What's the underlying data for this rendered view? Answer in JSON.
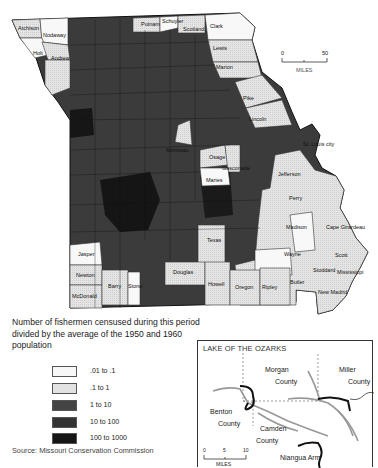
{
  "map": {
    "title": "Missouri counties — fishermen censused per capita",
    "scale_bar": {
      "start": "0",
      "end": "50",
      "unit": "MILES"
    },
    "labeled_counties": [
      {
        "name": "Atchison",
        "class": ".01 to .1"
      },
      {
        "name": "Nodaway",
        "class": ".01 to .1"
      },
      {
        "name": "Holt",
        "class": ".01 to .1"
      },
      {
        "name": "Andrew",
        "class": ".1 to 1"
      },
      {
        "name": "Buchanan",
        "class": ".1 to 1"
      },
      {
        "name": "Putnam",
        "class": ".1 to 1"
      },
      {
        "name": "Schuyler",
        "class": ".01 to .1"
      },
      {
        "name": "Scotland",
        "class": ".1 to 1"
      },
      {
        "name": "Clark",
        "class": ".01 to .1"
      },
      {
        "name": "Lewis",
        "class": ".1 to 1"
      },
      {
        "name": "Marion",
        "class": ".1 to 1"
      },
      {
        "name": "Pike",
        "class": ".1 to 1"
      },
      {
        "name": "Lincoln",
        "class": ".1 to 1"
      },
      {
        "name": "St. Louis city",
        "class": "outside"
      },
      {
        "name": "Moniteau",
        "class": ".1 to 1"
      },
      {
        "name": "Osage",
        "class": ".1 to 1"
      },
      {
        "name": "Gasconade",
        "class": ".1 to 1"
      },
      {
        "name": "Maries",
        "class": ".01 to .1"
      },
      {
        "name": "Jefferson",
        "class": ".1 to 1"
      },
      {
        "name": "Washington",
        "class": ".1 to 1"
      },
      {
        "name": "Ste. Genevieve",
        "class": ".1 to 1"
      },
      {
        "name": "St. Francois",
        "class": ".1 to 1"
      },
      {
        "name": "Perry",
        "class": ".1 to 1"
      },
      {
        "name": "Madison",
        "class": ".1 to 1"
      },
      {
        "name": "Bollinger",
        "class": ".01 to .1"
      },
      {
        "name": "Cape Girardeau",
        "class": ".1 to 1"
      },
      {
        "name": "Wayne",
        "class": ".01 to .1"
      },
      {
        "name": "Scott",
        "class": ".1 to 1"
      },
      {
        "name": "Stoddard",
        "class": ".1 to 1"
      },
      {
        "name": "Mississippi",
        "class": ".1 to 1"
      },
      {
        "name": "Texas",
        "class": ".1 to 1"
      },
      {
        "name": "Jasper",
        "class": ".01 to .1"
      },
      {
        "name": "Newton",
        "class": ".1 to 1"
      },
      {
        "name": "McDonald",
        "class": ".1 to 1"
      },
      {
        "name": "Barry",
        "class": ".1 to 1"
      },
      {
        "name": "Stone",
        "class": ".1 to 1"
      },
      {
        "name": "Douglas",
        "class": ".1 to 1"
      },
      {
        "name": "Howell",
        "class": ".1 to 1"
      },
      {
        "name": "Oregon",
        "class": ".1 to 1"
      },
      {
        "name": "Ripley",
        "class": ".1 to 1"
      },
      {
        "name": "Butler",
        "class": ".1 to 1"
      },
      {
        "name": "New Madrid",
        "class": ".1 to 1"
      },
      {
        "name": "Dunklin",
        "class": ".1 to 1"
      },
      {
        "name": "Pemiscot",
        "class": ".1 to 1"
      }
    ]
  },
  "legend": {
    "title": "Number of fishermen censused during this period divided by the average of the 1950 and 1960 population",
    "items": [
      {
        "label": ".01 to .1",
        "color": "#f7f7f7"
      },
      {
        "label": ".1 to 1",
        "color": "#e2e2e2"
      },
      {
        "label": "1 to 10",
        "color": "#444444"
      },
      {
        "label": "10 to 100",
        "color": "#333333"
      },
      {
        "label": "100 to 1000",
        "color": "#161616"
      }
    ]
  },
  "source": "Source: Missouri Conservation Commission",
  "inset": {
    "title": "LAKE OF THE OZARKS",
    "labels": {
      "morgan_1": "Morgan",
      "morgan_2": "County",
      "miller_1": "Miller",
      "miller_2": "County",
      "benton_1": "Benton",
      "benton_2": "County",
      "camden_1": "Camden",
      "camden_2": "County",
      "niangua": "Niangua Arm"
    },
    "scale_bar": {
      "start": "0",
      "mid": "5",
      "end": "10",
      "unit": "MILES"
    }
  }
}
